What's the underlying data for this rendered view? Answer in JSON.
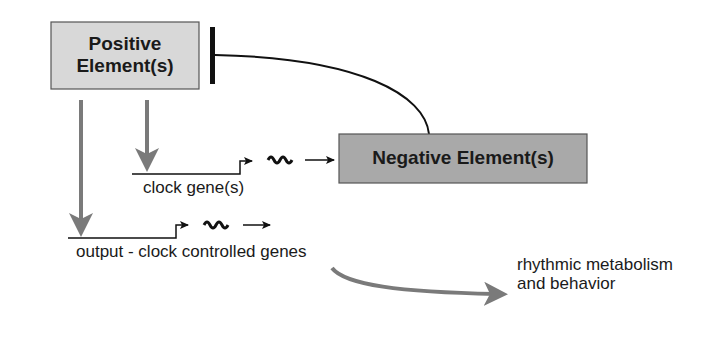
{
  "diagram": {
    "positive_box": {
      "label_line1": "Positive",
      "label_line2": "Element(s)",
      "fill": "#d8d8d8"
    },
    "negative_box": {
      "label": "Negative Element(s)",
      "fill": "#a9a9a9"
    },
    "clock_gene_label": "clock gene(s)",
    "output_label": "output - clock controlled genes",
    "result_label": "rhythmic metabolism and behavior",
    "colors": {
      "gray_arrow": "#7a7a7a",
      "line": "#111111"
    }
  }
}
